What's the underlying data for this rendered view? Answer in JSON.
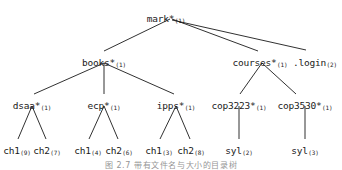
{
  "figure": {
    "type": "tree-diagram",
    "width": 342,
    "height": 170,
    "background": "#ffffff",
    "edge_color": "#1a1a1a",
    "text_color": "#1a1a1a",
    "caption": "图 2.7  带有文件名与大小的目录树"
  },
  "nodes": [
    {
      "id": "mark",
      "name": "mark*",
      "sub": "(1)",
      "x": 166,
      "y": 14,
      "level": 0
    },
    {
      "id": "books",
      "name": "books*",
      "sub": "(1)",
      "x": 104,
      "y": 58,
      "level": 1
    },
    {
      "id": "courses",
      "name": "courses*",
      "sub": "(1)",
      "x": 260,
      "y": 58,
      "level": 1
    },
    {
      "id": "login",
      "name": ".login",
      "sub": "(2)",
      "x": 315,
      "y": 58,
      "level": 1
    },
    {
      "id": "dsaa",
      "name": "dsaa*",
      "sub": "(1)",
      "x": 32,
      "y": 101,
      "level": 2
    },
    {
      "id": "ecp",
      "name": "ecp*",
      "sub": "(1)",
      "x": 104,
      "y": 101,
      "level": 2
    },
    {
      "id": "ipps",
      "name": "ipps*",
      "sub": "(1)",
      "x": 176,
      "y": 101,
      "level": 2
    },
    {
      "id": "cop3223",
      "name": "cop3223*",
      "sub": "(1)",
      "x": 239,
      "y": 101,
      "level": 2
    },
    {
      "id": "cop3530",
      "name": "cop3530*",
      "sub": "(1)",
      "x": 305,
      "y": 101,
      "level": 2
    },
    {
      "id": "dsaa_ch1",
      "name": "ch1",
      "sub": "(9)",
      "x": 17,
      "y": 146,
      "level": 3
    },
    {
      "id": "dsaa_ch2",
      "name": "ch2",
      "sub": "(7)",
      "x": 47,
      "y": 146,
      "level": 3
    },
    {
      "id": "ecp_ch1",
      "name": "ch1",
      "sub": "(4)",
      "x": 88,
      "y": 146,
      "level": 3
    },
    {
      "id": "ecp_ch2",
      "name": "ch2",
      "sub": "(6)",
      "x": 119,
      "y": 146,
      "level": 3
    },
    {
      "id": "ipps_ch1",
      "name": "ch1",
      "sub": "(3)",
      "x": 159,
      "y": 146,
      "level": 3
    },
    {
      "id": "ipps_ch2",
      "name": "ch2",
      "sub": "(8)",
      "x": 191,
      "y": 146,
      "level": 3
    },
    {
      "id": "syl_3223",
      "name": "syl",
      "sub": "(2)",
      "x": 239,
      "y": 146,
      "level": 3
    },
    {
      "id": "syl_3530",
      "name": "syl",
      "sub": "(3)",
      "x": 305,
      "y": 146,
      "level": 3
    }
  ],
  "edges": [
    {
      "from": "mark",
      "to": "books",
      "x1": 170,
      "y1": 19,
      "x2": 104,
      "y2": 51
    },
    {
      "from": "mark",
      "to": "courses",
      "x1": 172,
      "y1": 19,
      "x2": 258,
      "y2": 51
    },
    {
      "from": "mark",
      "to": "login",
      "x1": 172,
      "y1": 20,
      "x2": 306,
      "y2": 50
    },
    {
      "from": "books",
      "to": "dsaa",
      "x1": 104,
      "y1": 63,
      "x2": 34,
      "y2": 94
    },
    {
      "from": "books",
      "to": "ecp",
      "x1": 104,
      "y1": 63,
      "x2": 104,
      "y2": 94
    },
    {
      "from": "books",
      "to": "ipps",
      "x1": 104,
      "y1": 63,
      "x2": 174,
      "y2": 94
    },
    {
      "from": "courses",
      "to": "cop3223",
      "x1": 262,
      "y1": 63,
      "x2": 240,
      "y2": 94
    },
    {
      "from": "courses",
      "to": "cop3530",
      "x1": 262,
      "y1": 63,
      "x2": 296,
      "y2": 94
    },
    {
      "from": "dsaa",
      "to": "dsaa_ch1",
      "x1": 32,
      "y1": 106,
      "x2": 18,
      "y2": 139
    },
    {
      "from": "dsaa",
      "to": "dsaa_ch2",
      "x1": 32,
      "y1": 106,
      "x2": 46,
      "y2": 139
    },
    {
      "from": "ecp",
      "to": "ecp_ch1",
      "x1": 104,
      "y1": 106,
      "x2": 89,
      "y2": 139
    },
    {
      "from": "ecp",
      "to": "ecp_ch2",
      "x1": 104,
      "y1": 106,
      "x2": 118,
      "y2": 139
    },
    {
      "from": "ipps",
      "to": "ipps_ch1",
      "x1": 176,
      "y1": 106,
      "x2": 160,
      "y2": 139
    },
    {
      "from": "ipps",
      "to": "ipps_ch2",
      "x1": 176,
      "y1": 106,
      "x2": 190,
      "y2": 139
    },
    {
      "from": "cop3223",
      "to": "syl_3223",
      "x1": 239,
      "y1": 106,
      "x2": 239,
      "y2": 139
    },
    {
      "from": "cop3530",
      "to": "syl_3530",
      "x1": 305,
      "y1": 106,
      "x2": 305,
      "y2": 139
    }
  ]
}
